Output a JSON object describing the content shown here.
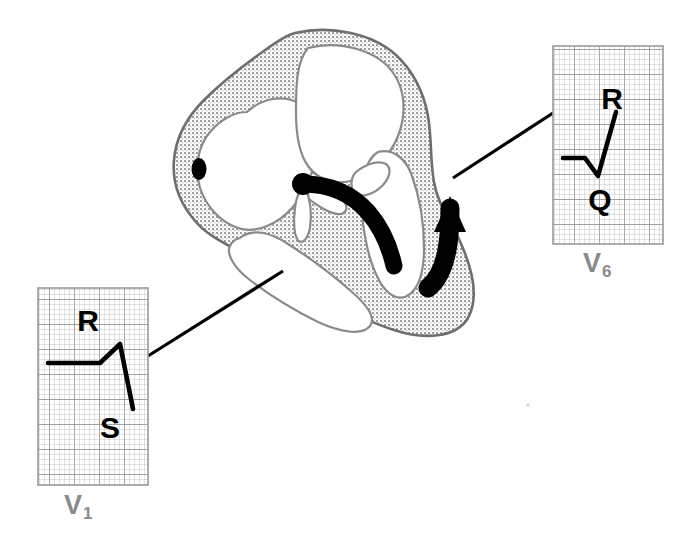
{
  "figure": {
    "kind": "medical-illustration",
    "background_color": "#ffffff"
  },
  "colors": {
    "myocardium_fill": "#d6d6d6",
    "myocardium_outline": "#6e6e6e",
    "chamber_fill": "#ffffff",
    "conduction_black": "#000000",
    "grid_minor": "#b9b9b9",
    "grid_major": "#8d8d8d",
    "panel_border": "#9a9a9a",
    "label_gray": "#8a8a8a",
    "trace_black": "#000000",
    "leader_line": "#000000"
  },
  "heart": {
    "name": "heart-cross-section",
    "annotations": {
      "nodal_dot": {
        "name": "black-oval-marker"
      },
      "conduction_bundle": {
        "name": "conduction-bundle-stripe"
      },
      "septal_origin_dot": {
        "name": "conduction-origin-dot"
      },
      "depolarization_arrow": {
        "name": "depolarization-arrow"
      }
    }
  },
  "ecg_panels": [
    {
      "id": "v1",
      "lead_label": "V",
      "lead_subscript": "1",
      "wave_labels": [
        {
          "text": "R",
          "x": 88,
          "y": 331
        },
        {
          "text": "S",
          "x": 108,
          "y": 428
        }
      ],
      "description": "small R wave followed by deep S wave"
    },
    {
      "id": "v6",
      "lead_label": "V",
      "lead_subscript": "6",
      "wave_labels": [
        {
          "text": "R",
          "x": 608,
          "y": 102
        },
        {
          "text": "Q",
          "x": 598,
          "y": 199
        }
      ],
      "description": "small Q wave followed by tall R wave"
    }
  ],
  "leader_lines": [
    {
      "name": "leader-line-v1",
      "from": [
        148,
        356
      ],
      "to": [
        283,
        271
      ]
    },
    {
      "name": "leader-line-v6",
      "from": [
        453,
        178
      ],
      "to": [
        553,
        113
      ]
    }
  ]
}
